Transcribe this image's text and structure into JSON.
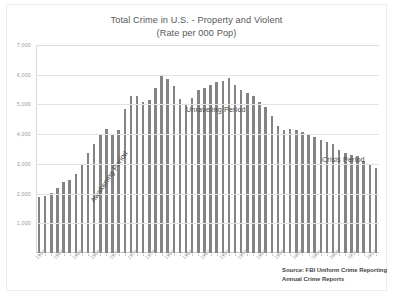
{
  "chart_data": {
    "type": "bar",
    "title": "Total Crime in U.S. - Property and Violent",
    "subtitle": "(Rate per 000 Pop)",
    "xlabel": "",
    "ylabel": "",
    "ylim": [
      0,
      7000
    ],
    "ytick_step": 1000,
    "ytick_labels": [
      "7,000",
      "6,000",
      "5,000",
      "4,000",
      "3,000",
      "2,000",
      "1,000"
    ],
    "ytick_values": [
      7000,
      6000,
      5000,
      4000,
      3000,
      2000,
      1000
    ],
    "grid": true,
    "legend": "none",
    "bar_color": "#848484",
    "xtick_labels": [
      "1960",
      "1963",
      "1966",
      "1969",
      "1972",
      "1975",
      "1978",
      "1981",
      "1984",
      "1987",
      "1990",
      "1993",
      "1996",
      "1999",
      "2002",
      "2005",
      "2008",
      "2011",
      "2014"
    ],
    "xtick_step_years": 3,
    "categories": [
      "1960",
      "1961",
      "1962",
      "1963",
      "1964",
      "1965",
      "1966",
      "1967",
      "1968",
      "1969",
      "1970",
      "1971",
      "1972",
      "1973",
      "1974",
      "1975",
      "1976",
      "1977",
      "1978",
      "1979",
      "1980",
      "1981",
      "1982",
      "1983",
      "1984",
      "1985",
      "1986",
      "1987",
      "1988",
      "1989",
      "1990",
      "1991",
      "1992",
      "1993",
      "1994",
      "1995",
      "1996",
      "1997",
      "1998",
      "1999",
      "2000",
      "2001",
      "2002",
      "2003",
      "2004",
      "2005",
      "2006",
      "2007",
      "2008",
      "2009",
      "2010",
      "2011",
      "2012",
      "2013",
      "2014",
      "2015"
    ],
    "values": [
      1887,
      1906,
      2020,
      2180,
      2388,
      2449,
      2671,
      2990,
      3370,
      3680,
      3985,
      4165,
      3961,
      4154,
      4850,
      5299,
      5287,
      5078,
      5140,
      5566,
      5950,
      5858,
      5604,
      5175,
      5031,
      5207,
      5480,
      5550,
      5664,
      5741,
      5803,
      5898,
      5660,
      5484,
      5374,
      5275,
      5087,
      4930,
      4620,
      4267,
      4125,
      4163,
      4125,
      4067,
      3977,
      3900,
      3809,
      3730,
      3669,
      3466,
      3350,
      3294,
      3255,
      3099,
      2971,
      2860
    ],
    "annotations": [
      {
        "name": "awakening-period",
        "text": "Awakening Period",
        "rotated": true
      },
      {
        "name": "unraveling-period",
        "text": "Unraveling Period",
        "rotated": false
      },
      {
        "name": "crisis-period",
        "text": "Crisis Period",
        "rotated": false
      }
    ],
    "source_note": {
      "line1": "Source: FBI Uniform Crime Reporting",
      "line2": "Annual Crime Reports"
    }
  }
}
